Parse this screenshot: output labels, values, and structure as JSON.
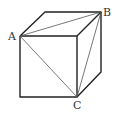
{
  "diagram": {
    "type": "cube",
    "labels": {
      "A": "A",
      "B": "B",
      "C": "C"
    },
    "colors": {
      "edge": "#222222",
      "diagonal": "#555555",
      "label": "#333333"
    }
  }
}
